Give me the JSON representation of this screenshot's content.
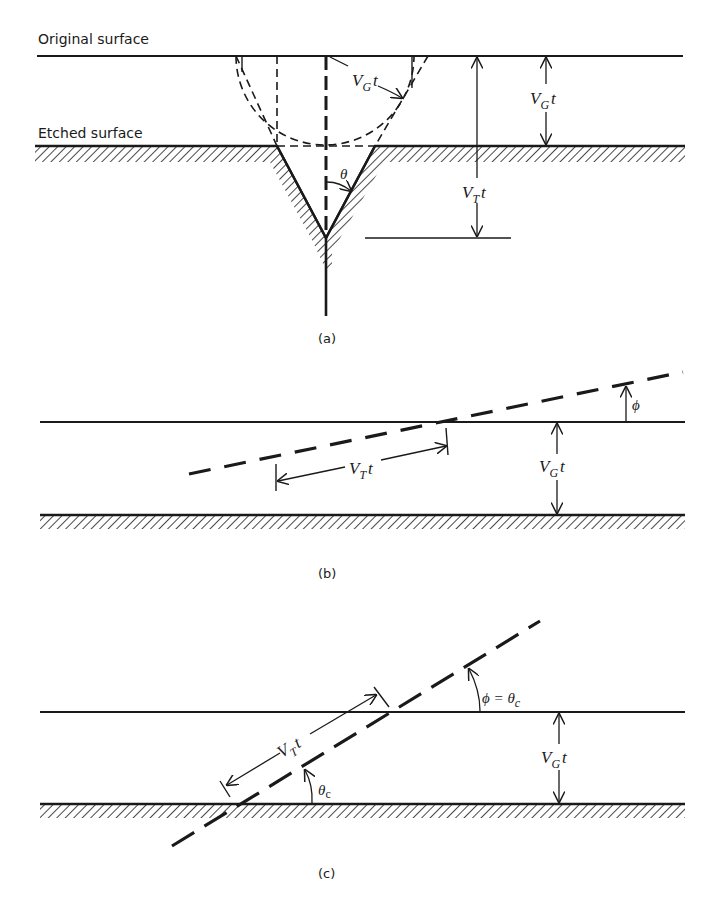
{
  "panels": [
    {
      "id": "a",
      "caption": "(a)",
      "labels": {
        "original_surface": "Original surface",
        "etched_surface": "Etched surface",
        "vg_arc": {
          "main": "V",
          "sub": "G",
          "tail": "t"
        },
        "vg_dim": {
          "main": "V",
          "sub": "G",
          "tail": "t"
        },
        "vt_dim": {
          "main": "V",
          "sub": "T",
          "tail": "t"
        },
        "theta": "θ"
      }
    },
    {
      "id": "b",
      "caption": "(b)",
      "labels": {
        "vt_dim": {
          "main": "V",
          "sub": "T",
          "tail": "t"
        },
        "vg_dim": {
          "main": "V",
          "sub": "G",
          "tail": "t"
        },
        "phi": "ϕ"
      }
    },
    {
      "id": "c",
      "caption": "(c)",
      "labels": {
        "vt_dim": {
          "main": "V",
          "sub": "T",
          "tail": "t"
        },
        "vg_dim": {
          "main": "V",
          "sub": "G",
          "tail": "t"
        },
        "theta_c": {
          "main": "θ",
          "sub": "c"
        },
        "phi_eq": {
          "main": "ϕ = θ",
          "sub": "c"
        }
      }
    }
  ],
  "colors": {
    "ink": "#1a1a1a",
    "background": "#ffffff"
  }
}
